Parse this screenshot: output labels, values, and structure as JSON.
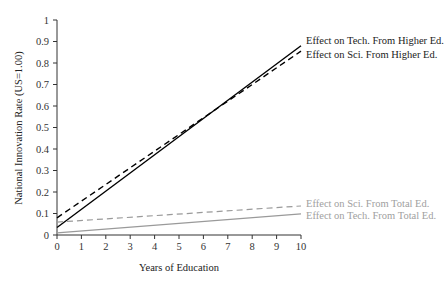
{
  "chart_data": {
    "type": "line",
    "title": "",
    "xlabel": "Years of Education",
    "ylabel": "National Innovation Rate (US=1.00)",
    "xlim": [
      0,
      10
    ],
    "ylim": [
      0,
      1
    ],
    "xticks": [
      0,
      1,
      2,
      3,
      4,
      5,
      6,
      7,
      8,
      9,
      10
    ],
    "yticks": [
      0,
      0.1,
      0.2,
      0.3,
      0.4,
      0.5,
      0.6,
      0.7,
      0.8,
      0.9,
      1
    ],
    "ytick_labels": [
      "0",
      "0.1",
      "0.2",
      "0.3",
      "0.4",
      "0.5",
      "0.6",
      "0.7",
      "0.8",
      "0.9",
      "1"
    ],
    "grid": false,
    "legend_position": "inline-right",
    "series": [
      {
        "name": "Effect on Tech. From Higher Ed.",
        "x": [
          0,
          10
        ],
        "values": [
          0.035,
          0.88
        ],
        "color": "#000000",
        "dash": false
      },
      {
        "name": "Effect on Sci. From Higher Ed.",
        "x": [
          0,
          10
        ],
        "values": [
          0.08,
          0.855
        ],
        "color": "#000000",
        "dash": true
      },
      {
        "name": "Effect on Sci. From Total Ed.",
        "x": [
          0,
          10
        ],
        "values": [
          0.06,
          0.135
        ],
        "color": "#9a9a9a",
        "dash": true
      },
      {
        "name": "Effect on Tech. From Total Ed.",
        "x": [
          0,
          10
        ],
        "values": [
          0.01,
          0.098
        ],
        "color": "#9a9a9a",
        "dash": false
      }
    ]
  }
}
